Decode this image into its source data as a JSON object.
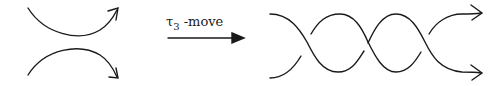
{
  "diagram": {
    "arrow_label": {
      "symbol": "τ",
      "subscript": "3",
      "suffix": " -move"
    },
    "left_figure": "two strands (arcs), no crossing",
    "right_figure": "two strands with three crossings",
    "stroke_color": "#1a1a1a"
  }
}
